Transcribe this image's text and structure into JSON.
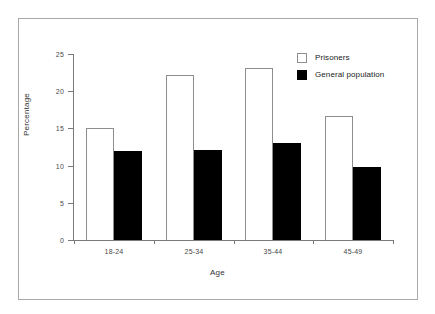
{
  "chart_data": {
    "type": "bar",
    "title": "",
    "xlabel": "Age",
    "ylabel": "Percentage",
    "categories": [
      "18-24",
      "25-34",
      "35-44",
      "45-49"
    ],
    "series": [
      {
        "name": "Prisoners",
        "values": [
          15.0,
          22.2,
          23.1,
          16.6
        ],
        "style": "open",
        "color": "#ffffff",
        "edge_color": "#8e8e8e"
      },
      {
        "name": "General population",
        "values": [
          12.0,
          12.1,
          13.0,
          9.8
        ],
        "style": "filled",
        "color": "#000000",
        "edge_color": "#000000"
      }
    ],
    "ylim": [
      0,
      25
    ],
    "yticks": [
      0,
      5,
      10,
      15,
      20,
      25
    ],
    "ytick_labels": [
      "0",
      "5",
      "10",
      "15",
      "20",
      "25"
    ],
    "grid": false,
    "legend_position": "top-right",
    "frame": true,
    "frame_color": "#a8a8a8",
    "axis_color": "#7a7a7a"
  }
}
